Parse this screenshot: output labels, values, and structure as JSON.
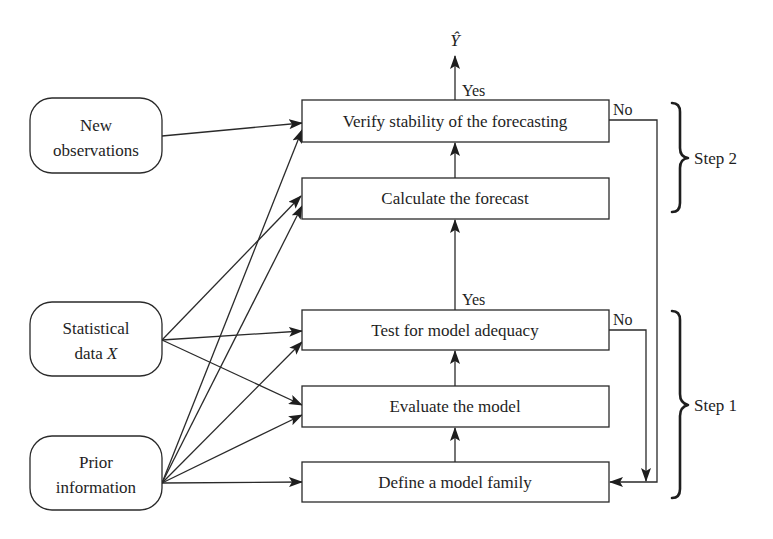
{
  "diagram": {
    "output_label": "Ŷ",
    "inputs": {
      "new_observations": {
        "line1": "New",
        "line2": "observations"
      },
      "statistical_data": {
        "line1": "Statistical",
        "line2_prefix": "data ",
        "line2_var": "X"
      },
      "prior_information": {
        "line1": "Prior",
        "line2": "information"
      }
    },
    "process": [
      {
        "id": "verify",
        "label": "Verify stability of the forecasting"
      },
      {
        "id": "calculate",
        "label": "Calculate the forecast"
      },
      {
        "id": "test",
        "label": "Test for model adequacy"
      },
      {
        "id": "evaluate",
        "label": "Evaluate the model"
      },
      {
        "id": "define",
        "label": "Define a model family"
      }
    ],
    "decisions": {
      "verify_yes": "Yes",
      "verify_no": "No",
      "test_yes": "Yes",
      "test_no": "No"
    },
    "steps": {
      "step2": "Step 2",
      "step1": "Step 1"
    },
    "colors": {
      "line": "#2a2a2a",
      "text": "#1e1e1e",
      "background": "#ffffff"
    }
  }
}
